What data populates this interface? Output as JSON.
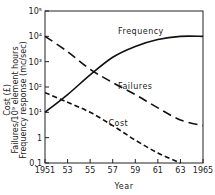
{
  "chart_data": {
    "type": "line",
    "title": "",
    "xlabel": "Year",
    "ylabel_lines": [
      "Cost (£)",
      "Failures/10⁹ element hours",
      "Frequency response (mc/sec)"
    ],
    "yscale": "log",
    "ylim": [
      0.1,
      100000
    ],
    "xlim": [
      1951,
      1965
    ],
    "x_tick_labels": [
      "1951",
      "53",
      "55",
      "57",
      "59",
      "61",
      "63",
      "1965"
    ],
    "x_ticks": [
      1951,
      1953,
      1955,
      1957,
      1959,
      1961,
      1963,
      1965
    ],
    "y_tick_labels": [
      "0.1",
      "1",
      "10¹",
      "10²",
      "10³",
      "10⁴",
      "10⁵"
    ],
    "y_ticks": [
      0.1,
      1,
      10,
      100,
      1000,
      10000,
      100000
    ],
    "grid": false,
    "legend": "inline labels",
    "series": [
      {
        "name": "Frequency",
        "style": "solid",
        "x": [
          1951,
          1953,
          1955,
          1957,
          1959,
          1961,
          1963,
          1965
        ],
        "values": [
          10,
          50,
          300,
          1500,
          4000,
          7500,
          10000,
          10000
        ]
      },
      {
        "name": "Failures",
        "style": "long-dash",
        "x": [
          1951,
          1953,
          1955,
          1957,
          1959,
          1961,
          1963,
          1965
        ],
        "values": [
          10000,
          2500,
          500,
          150,
          50,
          15,
          5,
          3
        ]
      },
      {
        "name": "Cost",
        "style": "short-dash",
        "x": [
          1951,
          1953,
          1955,
          1957,
          1959,
          1961,
          1963
        ],
        "values": [
          60,
          25,
          10,
          3,
          0.8,
          0.25,
          0.1
        ]
      }
    ],
    "annotations": [
      {
        "text": "Frequency",
        "x": 1959.5,
        "y": 12000
      },
      {
        "text": "Failures",
        "x": 1959,
        "y": 80
      },
      {
        "text": "Cost",
        "x": 1957.5,
        "y": 3
      }
    ]
  }
}
